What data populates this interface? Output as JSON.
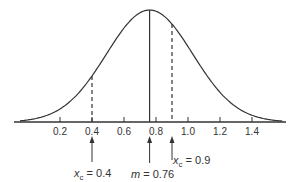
{
  "chart_data": {
    "type": "line",
    "title": "",
    "xlabel": "",
    "ylabel": "",
    "xlim": [
      0.0,
      1.6
    ],
    "x_ticks": [
      0.2,
      0.4,
      0.6,
      0.8,
      1.0,
      1.2,
      1.4
    ],
    "x_tick_labels": [
      "0.2",
      "0.4",
      "0.6",
      "0.8",
      "1.0",
      "1.2",
      "1.4"
    ],
    "grid": false,
    "series": [
      {
        "name": "density",
        "mean": 0.76,
        "sd": 0.27,
        "style": "solid"
      }
    ],
    "markers": [
      {
        "x": 0.4,
        "style": "dashed",
        "label": "x_c = 0.4"
      },
      {
        "x": 0.76,
        "style": "solid",
        "label": "m = 0.76"
      },
      {
        "x": 0.9,
        "style": "dashed",
        "label": "x_c = 0.9"
      }
    ]
  },
  "annotations": {
    "xc_low": {
      "var": "x",
      "sub": "c",
      "text": " = 0.4"
    },
    "mean": {
      "var": "m",
      "text": " = 0.76"
    },
    "xc_high": {
      "var": "x",
      "sub": "c",
      "text": " = 0.9"
    }
  }
}
